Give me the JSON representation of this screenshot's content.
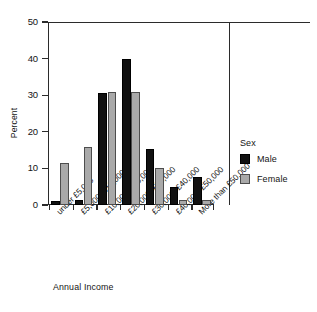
{
  "chart_data": {
    "type": "bar",
    "title": "",
    "xlabel": "Annual Income",
    "ylabel": "Percent",
    "ylim": [
      0,
      50
    ],
    "yticks": [
      0,
      10,
      20,
      30,
      40,
      50
    ],
    "grid": false,
    "legend": {
      "title": "Sex",
      "position": "right",
      "entries": [
        {
          "name": "Male",
          "color": "#111111"
        },
        {
          "name": "Female",
          "color": "#a9a9a9"
        }
      ]
    },
    "categories": [
      "under £5,000",
      "£5,000–£10,000",
      "£10,000–£20,000",
      "£20,000–£30,000",
      "£30,000–£40,000",
      "£40,000–£50,000",
      "More than £50,000"
    ],
    "series": [
      {
        "name": "Male",
        "color": "#111111",
        "values": [
          1.0,
          1.5,
          30.7,
          40.0,
          15.4,
          5.0,
          7.7
        ]
      },
      {
        "name": "Female",
        "color": "#a9a9a9",
        "values": [
          11.5,
          15.8,
          30.8,
          31.0,
          10.2,
          1.5,
          1.3
        ]
      }
    ]
  },
  "axes": {
    "y_tick_labels": [
      "0",
      "10",
      "20",
      "30",
      "40",
      "50"
    ],
    "y_title": "Percent",
    "x_title": "Annual Income"
  },
  "legend": {
    "title": "Sex",
    "male_label": "Male",
    "female_label": "Female"
  }
}
